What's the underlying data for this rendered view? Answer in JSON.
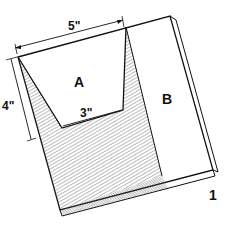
{
  "figure": {
    "number": "1",
    "regions": [
      {
        "id": "A",
        "label": "A"
      },
      {
        "id": "B",
        "label": "B"
      }
    ],
    "dimensions": {
      "top_width": "5\"",
      "bottom_width": "3\"",
      "height": "4\""
    },
    "colors": {
      "ink": "#111111",
      "paper": "#ffffff",
      "hatch": "#555555"
    }
  }
}
